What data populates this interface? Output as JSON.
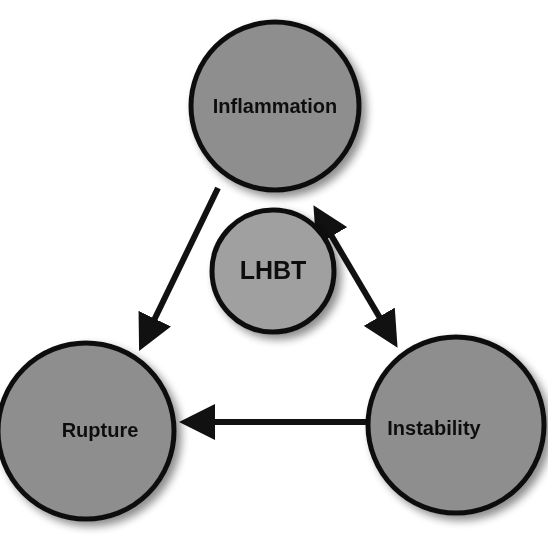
{
  "diagram": {
    "title": "",
    "colors": {
      "node_fill": "#8e8e8e",
      "center_fill": "#a0a0a0",
      "stroke": "#111111",
      "background": "#ffffff"
    },
    "nodes": [
      {
        "id": "inflammation",
        "label": "Inflammation",
        "cx": 275,
        "cy": 106,
        "r": 84
      },
      {
        "id": "lhbt",
        "label": "LHBT",
        "cx": 273,
        "cy": 271,
        "r": 61
      },
      {
        "id": "rupture",
        "label": "Rupture",
        "cx": 86,
        "cy": 431,
        "r": 88
      },
      {
        "id": "instability",
        "label": "Instability",
        "cx": 456,
        "cy": 425,
        "r": 88
      }
    ],
    "edges": [
      {
        "from": "inflammation",
        "to": "rupture",
        "direction": "forward"
      },
      {
        "from": "inflammation",
        "to": "instability",
        "direction": "both"
      },
      {
        "from": "instability",
        "to": "rupture",
        "direction": "forward"
      }
    ]
  }
}
